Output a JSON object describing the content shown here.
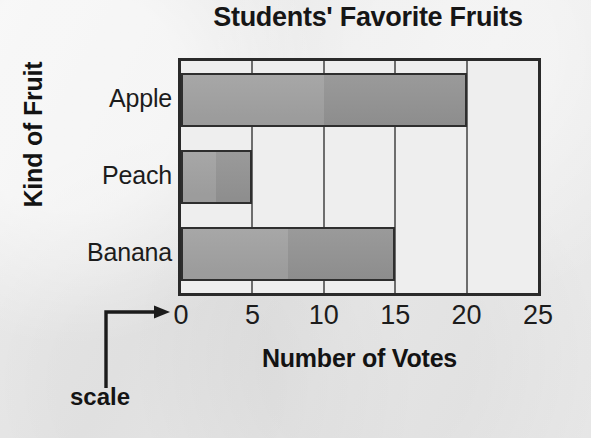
{
  "chart_data": {
    "type": "bar",
    "orientation": "horizontal",
    "title": "Students' Favorite Fruits",
    "xlabel": "Number of Votes",
    "ylabel": "Kind of Fruit",
    "categories": [
      "Apple",
      "Peach",
      "Banana"
    ],
    "values": [
      20,
      5,
      15
    ],
    "xlim": [
      0,
      25
    ],
    "xticks": [
      0,
      5,
      10,
      15,
      20,
      25
    ],
    "xtick_labels": [
      "0",
      "5",
      "10",
      "15",
      "20",
      "25"
    ],
    "grid": "vertical",
    "legend": "none",
    "bar_color": "#9b9b9b",
    "bar_edge_color": "#2e2e2e",
    "plot_background": "#eeeeee",
    "page_background": "#ebebeb",
    "annotations": [
      {
        "text": "scale",
        "points_to": "x-axis-tick-0",
        "style": "elbow-arrow"
      }
    ]
  },
  "title": {
    "text": "Students' Favorite Fruits"
  },
  "axes": {
    "x": {
      "label": "Number of Votes",
      "ticks": [
        "0",
        "5",
        "10",
        "15",
        "20",
        "25"
      ]
    },
    "y": {
      "label": "Kind of Fruit",
      "categories": [
        "Apple",
        "Peach",
        "Banana"
      ]
    }
  },
  "annotation": {
    "scale_label": "scale"
  }
}
